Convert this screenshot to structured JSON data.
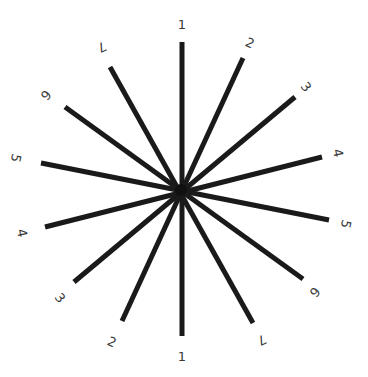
{
  "diagram": {
    "type": "astigmatism-dial",
    "center": [
      181,
      190
    ],
    "colors": {
      "background": "#ffffff",
      "line": "#1a1a1a",
      "label": "#3a3a3a"
    },
    "lines": [
      {
        "label": "1",
        "end_a": [
          182,
          42
        ],
        "end_b": [
          182,
          336
        ],
        "label_a": [
          182,
          24
        ],
        "label_b": [
          182,
          356
        ],
        "rot_a": 0,
        "rot_b": 0
      },
      {
        "label": "2",
        "end_a": [
          243,
          58
        ],
        "end_b": [
          122,
          321
        ],
        "label_a": [
          250,
          43
        ],
        "label_b": [
          112,
          342
        ],
        "rot_a": 25,
        "rot_b": 25
      },
      {
        "label": "3",
        "end_a": [
          295,
          97
        ],
        "end_b": [
          74,
          282
        ],
        "label_a": [
          306,
          87
        ],
        "label_b": [
          60,
          298
        ],
        "rot_a": 51,
        "rot_b": 51
      },
      {
        "label": "4",
        "end_a": [
          322,
          157
        ],
        "end_b": [
          45,
          227
        ],
        "label_a": [
          338,
          153
        ],
        "label_b": [
          22,
          233
        ],
        "rot_a": 77,
        "rot_b": 77
      },
      {
        "label": "5",
        "end_a": [
          329,
          220
        ],
        "end_b": [
          41,
          163
        ],
        "label_a": [
          346,
          224
        ],
        "label_b": [
          16,
          158
        ],
        "rot_a": 103,
        "rot_b": 103
      },
      {
        "label": "6",
        "end_a": [
          303,
          279
        ],
        "end_b": [
          65,
          107
        ],
        "label_a": [
          315,
          292
        ],
        "label_b": [
          46,
          95
        ],
        "rot_a": 129,
        "rot_b": 129
      },
      {
        "label": "7",
        "end_a": [
          253,
          323
        ],
        "end_b": [
          110,
          67
        ],
        "label_a": [
          262,
          340
        ],
        "label_b": [
          102,
          47
        ],
        "rot_a": 155,
        "rot_b": 155
      }
    ]
  }
}
